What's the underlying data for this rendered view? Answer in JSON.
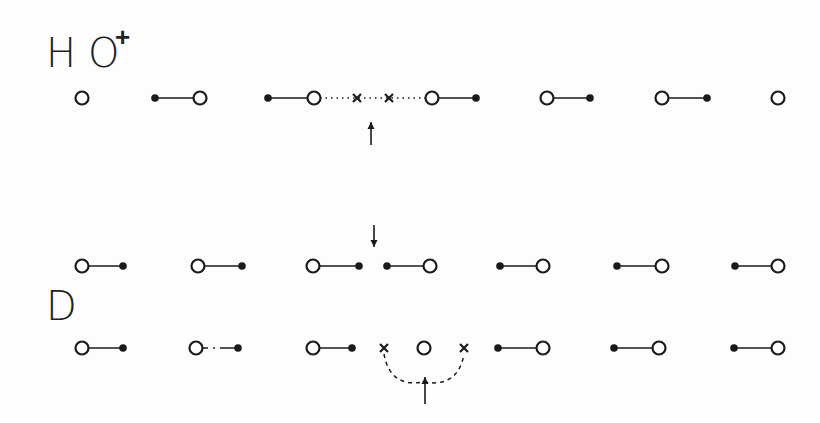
{
  "labels": {
    "h": {
      "text": "H",
      "x": 46,
      "y": 33
    },
    "o": {
      "text": "O",
      "x": 88,
      "y": 33
    },
    "plus": {
      "text": "+",
      "x": 115,
      "y": 24
    },
    "d": {
      "text": "D",
      "x": 46,
      "y": 286
    }
  },
  "colors": {
    "ink": "#1a1a1a",
    "background": "#fdfdfd"
  },
  "rows": [
    {
      "name": "hydronium-row",
      "y": 98,
      "items": [
        {
          "type": "open",
          "x": 82
        },
        {
          "type": "bond",
          "x1": 155,
          "x2": 200,
          "dot": "left"
        },
        {
          "type": "bond",
          "x1": 268,
          "x2": 314,
          "dot": "left"
        },
        {
          "type": "dotted",
          "x1": 320,
          "x2": 426
        },
        {
          "type": "cross",
          "x": 357
        },
        {
          "type": "cross",
          "x": 389
        },
        {
          "type": "bond",
          "x1": 432,
          "x2": 476,
          "dot": "right"
        },
        {
          "type": "bond",
          "x1": 547,
          "x2": 590,
          "dot": "right"
        },
        {
          "type": "bond",
          "x1": 662,
          "x2": 707,
          "dot": "right"
        },
        {
          "type": "open",
          "x": 778
        }
      ],
      "arrow": {
        "x": 371,
        "y1": 145,
        "y2": 122,
        "dir": "up"
      }
    },
    {
      "name": "deficiency-row-upper",
      "y": 266,
      "items": [
        {
          "type": "bond",
          "x1": 82,
          "x2": 123,
          "dot": "right"
        },
        {
          "type": "bond",
          "x1": 198,
          "x2": 242,
          "dot": "right"
        },
        {
          "type": "bond",
          "x1": 313,
          "x2": 359,
          "dot": "right"
        },
        {
          "type": "bond",
          "x1": 387,
          "x2": 430,
          "dot": "left"
        },
        {
          "type": "bond",
          "x1": 500,
          "x2": 543,
          "dot": "left"
        },
        {
          "type": "bond",
          "x1": 617,
          "x2": 662,
          "dot": "left"
        },
        {
          "type": "bond",
          "x1": 735,
          "x2": 778,
          "dot": "left"
        }
      ],
      "arrow": {
        "x": 374,
        "y1": 225,
        "y2": 247,
        "dir": "down"
      }
    },
    {
      "name": "deficiency-row-lower",
      "y": 348,
      "items": [
        {
          "type": "bond",
          "x1": 82,
          "x2": 123,
          "dot": "right"
        },
        {
          "type": "brokenbond",
          "x1": 196,
          "x2": 238,
          "dot": "right"
        },
        {
          "type": "bond",
          "x1": 313,
          "x2": 352,
          "dot": "right"
        },
        {
          "type": "cross",
          "x": 384
        },
        {
          "type": "open",
          "x": 424
        },
        {
          "type": "cross",
          "x": 464
        },
        {
          "type": "bond",
          "x1": 498,
          "x2": 543,
          "dot": "left"
        },
        {
          "type": "bond",
          "x1": 614,
          "x2": 659,
          "dot": "left"
        },
        {
          "type": "bond",
          "x1": 734,
          "x2": 778,
          "dot": "left"
        }
      ],
      "arc": {
        "x1": 384,
        "x2": 464,
        "cy": 350,
        "depth": 40
      },
      "arrow": {
        "x": 425,
        "y1": 404,
        "y2": 377,
        "dir": "up"
      }
    }
  ]
}
